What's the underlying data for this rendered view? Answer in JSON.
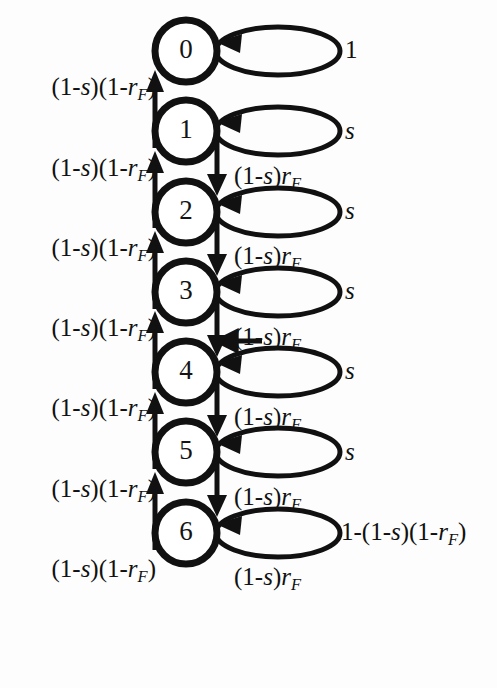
{
  "figure": {
    "type": "state-transition-diagram",
    "title": "",
    "background_color": "#fdfdfd",
    "stroke_color": "#111111",
    "states": [
      {
        "id": "0",
        "label": "0",
        "cx": 186,
        "cy": 51
      },
      {
        "id": "1",
        "label": "1",
        "cx": 186,
        "cy": 131
      },
      {
        "id": "2",
        "label": "2",
        "cx": 186,
        "cy": 212
      },
      {
        "id": "3",
        "label": "3",
        "cx": 186,
        "cy": 292
      },
      {
        "id": "4",
        "label": "4",
        "cx": 186,
        "cy": 372
      },
      {
        "id": "5",
        "label": "5",
        "cx": 186,
        "cy": 452
      },
      {
        "id": "6",
        "label": "6",
        "cx": 186,
        "cy": 533
      }
    ],
    "self_loops": [
      {
        "state": "0",
        "label_html": "1",
        "label_plain": "1",
        "cy": 51,
        "label_x": 345
      },
      {
        "state": "1",
        "label_html": "<i>s</i>",
        "label_plain": "s",
        "cy": 131,
        "label_x": 345
      },
      {
        "state": "2",
        "label_html": "<i>s</i>",
        "label_plain": "s",
        "cy": 212,
        "label_x": 345
      },
      {
        "state": "3",
        "label_html": "<i>s</i>",
        "label_plain": "s",
        "cy": 292,
        "label_x": 345
      },
      {
        "state": "4",
        "label_html": "<i>s</i>",
        "label_plain": "s",
        "cy": 372,
        "label_x": 345
      },
      {
        "state": "5",
        "label_html": "<i>s</i>",
        "label_plain": "s",
        "cy": 452,
        "label_x": 345
      },
      {
        "state": "6",
        "label_html": "1-(1-<i>s</i>)(1-<i>r</i><sub>F</sub>)",
        "label_plain": "1-(1-s)(1-rF)",
        "cy": 533,
        "label_x": 341
      }
    ],
    "up_transitions": [
      {
        "from": "1",
        "to": "0",
        "label_html": "(1-<i>s</i>)(1-<i>r</i><sub>F</sub>)",
        "label_plain": "(1-s)(1-rF)",
        "label_cy": 89
      },
      {
        "from": "2",
        "to": "1",
        "label_html": "(1-<i>s</i>)(1-<i>r</i><sub>F</sub>)",
        "label_plain": "(1-s)(1-rF)",
        "label_cy": 170
      },
      {
        "from": "3",
        "to": "2",
        "label_html": "(1-<i>s</i>)(1-<i>r</i><sub>F</sub>)",
        "label_plain": "(1-s)(1-rF)",
        "label_cy": 250
      },
      {
        "from": "4",
        "to": "3",
        "label_html": "(1-<i>s</i>)(1-<i>r</i><sub>F</sub>)",
        "label_plain": "(1-s)(1-rF)",
        "label_cy": 330
      },
      {
        "from": "5",
        "to": "4",
        "label_html": "(1-<i>s</i>)(1-<i>r</i><sub>F</sub>)",
        "label_plain": "(1-s)(1-rF)",
        "label_cy": 410
      },
      {
        "from": "6",
        "to": "5",
        "label_html": "(1-<i>s</i>)(1-<i>r</i><sub>F</sub>)",
        "label_plain": "(1-s)(1-rF)",
        "label_cy": 491
      },
      {
        "from": "6",
        "to": "5",
        "label_html": "(1-<i>s</i>)(1-<i>r</i><sub>F</sub>)",
        "label_plain": "(1-s)(1-rF)",
        "label_cy": 571
      }
    ],
    "down_transitions": [
      {
        "from": "1",
        "to": "2",
        "label_html": "(1-<i>s</i>)<i>r</i><sub>F</sub>",
        "label_plain": "(1-s)rF",
        "label_cy": 178
      },
      {
        "from": "2",
        "to": "3",
        "label_html": "(1-<i>s</i>)<i>r</i><sub>F</sub>",
        "label_plain": "(1-s)rF",
        "label_cy": 258
      },
      {
        "from": "3",
        "to": "4",
        "label_html": "(1-<i>s</i>)<i>r</i><sub>F</sub>",
        "label_plain": "(1-s)rF",
        "label_cy": 339
      },
      {
        "from": "4",
        "to": "5",
        "label_html": "(1-<i>s</i>)<i>r</i><sub>F</sub>",
        "label_plain": "(1-s)rF",
        "label_cy": 419
      },
      {
        "from": "5",
        "to": "6",
        "label_html": "(1-<i>s</i>)<i>r</i><sub>F</sub>",
        "label_plain": "(1-s)rF",
        "label_cy": 499
      },
      {
        "from": "6",
        "to": "6",
        "label_html": "(1-<i>s</i>)<i>r</i><sub>F</sub>",
        "label_plain": "(1-s)rF",
        "label_cy": 579
      }
    ],
    "geometry": {
      "node_radius": 31,
      "node_stroke_width": 7,
      "edge_stroke_width": 5,
      "up_line_x": 155,
      "down_line_x": 217,
      "loop_rx": 62,
      "loop_ry": 24,
      "loop_left_x": 216,
      "label_left_right_edge": 156,
      "label_down_x": 234
    }
  }
}
